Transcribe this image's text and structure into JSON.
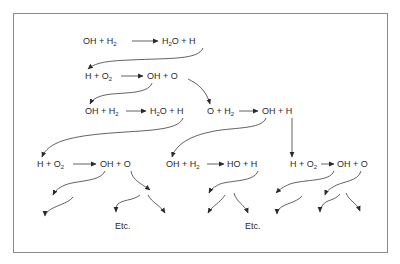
{
  "diagram": {
    "reactions": [
      {
        "id": "r1",
        "lhs": "OH + H₂",
        "rhs": "H₂O + H",
        "x": 83,
        "y": 42
      },
      {
        "id": "r2",
        "lhs": "H + O₂",
        "rhs": "OH + O",
        "x": 85,
        "y": 76
      },
      {
        "id": "r3",
        "lhs": "OH + H₂",
        "rhs": "H₂O + H",
        "x": 85,
        "y": 112
      },
      {
        "id": "r4",
        "lhs": "O + H₂",
        "rhs": "OH + H",
        "x": 207,
        "y": 112
      },
      {
        "id": "r5",
        "lhs": "H + O₂",
        "rhs": "OH + O",
        "x": 37,
        "y": 165
      },
      {
        "id": "r6",
        "lhs": "OH + H₂",
        "rhs": "HO + H",
        "x": 166,
        "y": 165
      },
      {
        "id": "r7",
        "lhs": "H + O₂",
        "rhs": "OH + O",
        "x": 290,
        "y": 165
      }
    ],
    "continuation_labels": [
      "Etc.",
      "Etc."
    ],
    "colors": {
      "ink": "#2a2a2a",
      "frame": "#8a8a8a",
      "background": "#ffffff"
    }
  }
}
